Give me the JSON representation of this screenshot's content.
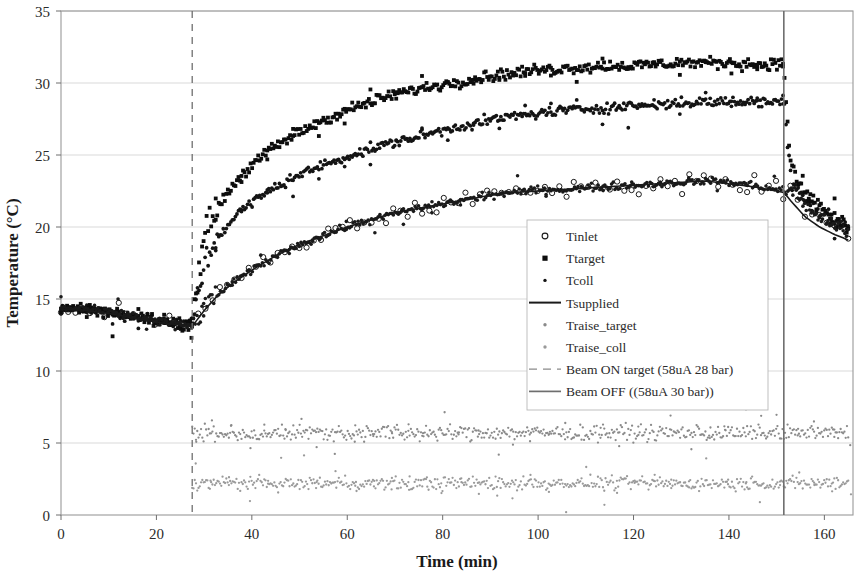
{
  "chart_data": {
    "type": "scatter",
    "title": "",
    "xlabel": "Time (min)",
    "ylabel": "Temperature (°C)",
    "xlim": [
      0,
      166
    ],
    "ylim": [
      0,
      35
    ],
    "xticks": [
      0,
      20,
      40,
      60,
      80,
      100,
      120,
      140,
      160
    ],
    "yticks": [
      0,
      5,
      10,
      15,
      20,
      25,
      30,
      35
    ],
    "grid": true,
    "legend_position": "center-right",
    "beam_on_time": 27.5,
    "beam_off_time": 151.5,
    "series": [
      {
        "name": "Tinlet",
        "marker": "open-circle",
        "color": "#1a1a1a",
        "x": [
          0,
          5,
          10,
          15,
          20,
          25,
          27.5,
          30,
          33,
          36,
          40,
          45,
          50,
          55,
          60,
          65,
          70,
          75,
          80,
          85,
          90,
          95,
          100,
          105,
          110,
          115,
          120,
          125,
          130,
          135,
          140,
          145,
          150,
          151.5,
          153,
          156,
          159,
          162,
          165
        ],
        "y": [
          14.4,
          14.3,
          14.1,
          13.8,
          13.5,
          13.2,
          13.1,
          14.4,
          15.4,
          16.1,
          17.0,
          18.0,
          18.8,
          19.4,
          20.0,
          20.5,
          20.9,
          21.3,
          21.6,
          21.9,
          22.2,
          22.4,
          22.6,
          22.6,
          22.7,
          22.8,
          22.9,
          23.0,
          23.1,
          23.2,
          23.1,
          22.9,
          22.6,
          22.6,
          22.6,
          21.5,
          20.7,
          20.1,
          19.6
        ]
      },
      {
        "name": "Ttarget",
        "marker": "filled-square",
        "color": "#0d0d0d",
        "x": [
          0,
          5,
          10,
          15,
          20,
          25,
          27.5,
          29,
          31,
          34,
          37,
          40,
          45,
          50,
          55,
          60,
          65,
          70,
          75,
          80,
          85,
          90,
          95,
          100,
          105,
          110,
          115,
          120,
          125,
          130,
          135,
          140,
          145,
          150,
          151.5,
          153,
          156,
          159,
          162,
          165
        ],
        "y": [
          14.4,
          14.3,
          14.1,
          13.8,
          13.5,
          13.2,
          13.3,
          17.5,
          20.3,
          22.0,
          23.3,
          24.3,
          25.6,
          26.6,
          27.4,
          28.1,
          28.7,
          29.2,
          29.6,
          29.9,
          30.2,
          30.5,
          30.7,
          30.9,
          31.0,
          31.1,
          31.2,
          31.2,
          31.3,
          31.4,
          31.4,
          31.4,
          31.3,
          31.3,
          31.3,
          24.0,
          22.4,
          21.4,
          20.6,
          20.0
        ]
      },
      {
        "name": "Tcoll",
        "marker": "small-dot",
        "color": "#141414",
        "x": [
          0,
          5,
          10,
          15,
          20,
          25,
          27.5,
          29,
          31,
          34,
          37,
          40,
          45,
          50,
          55,
          60,
          65,
          70,
          75,
          80,
          85,
          90,
          95,
          100,
          105,
          110,
          115,
          120,
          125,
          130,
          135,
          140,
          145,
          150,
          151.5,
          153,
          156,
          159,
          162,
          165
        ],
        "y": [
          14.4,
          14.3,
          14.1,
          13.8,
          13.5,
          13.2,
          13.3,
          16.0,
          18.2,
          19.8,
          20.9,
          21.7,
          22.8,
          23.6,
          24.3,
          24.9,
          25.4,
          25.9,
          26.3,
          26.7,
          27.1,
          27.4,
          27.7,
          27.9,
          28.1,
          28.2,
          28.3,
          28.4,
          28.5,
          28.6,
          28.7,
          28.7,
          28.7,
          28.7,
          28.7,
          23.5,
          22.0,
          21.0,
          20.3,
          19.8
        ]
      },
      {
        "name": "Tsupplied",
        "marker": "line",
        "color": "#1a1a1a",
        "x": [
          0,
          5,
          10,
          15,
          20,
          25,
          27.5,
          30,
          33,
          36,
          40,
          45,
          50,
          55,
          60,
          65,
          70,
          75,
          80,
          85,
          90,
          95,
          100,
          105,
          110,
          115,
          120,
          125,
          130,
          135,
          140,
          145,
          150,
          151.5,
          153,
          156,
          159,
          162,
          165
        ],
        "y": [
          14.3,
          14.2,
          14.0,
          13.7,
          13.4,
          13.2,
          13.1,
          14.2,
          15.3,
          16.1,
          17.0,
          18.0,
          18.8,
          19.4,
          20.0,
          20.5,
          21.0,
          21.3,
          21.6,
          21.9,
          22.2,
          22.4,
          22.5,
          22.6,
          22.7,
          22.8,
          22.9,
          23.0,
          23.1,
          23.2,
          23.0,
          22.8,
          22.5,
          22.4,
          21.8,
          20.7,
          20.0,
          19.5,
          19.1
        ]
      },
      {
        "name": "Traise_target",
        "marker": "small-dot",
        "color": "#8a8a8a",
        "constant_value": 5.7,
        "x_start": 27.5,
        "x_end": 165,
        "scatter_spread": 0.45
      },
      {
        "name": "Traise_coll",
        "marker": "small-dot",
        "color": "#9a9a9a",
        "constant_value": 2.2,
        "x_start": 27.5,
        "x_end": 165,
        "scatter_spread": 0.4
      }
    ],
    "vlines": [
      {
        "name": "Beam ON target (58uA 28 bar)",
        "x": 27.5,
        "style": "dashed",
        "color": "#6e6e6e"
      },
      {
        "name": "Beam OFF ((58uA 30 bar))",
        "x": 151.5,
        "style": "solid",
        "color": "#6e6e6e"
      }
    ],
    "legend": [
      {
        "label": "Tinlet",
        "marker": "open-circle",
        "color": "#1a1a1a"
      },
      {
        "label": "Ttarget",
        "marker": "filled-square",
        "color": "#0d0d0d"
      },
      {
        "label": "Tcoll",
        "marker": "small-dot",
        "color": "#141414"
      },
      {
        "label": "Tsupplied",
        "marker": "line",
        "color": "#1a1a1a"
      },
      {
        "label": "Traise_target",
        "marker": "small-dot",
        "color": "#8a8a8a"
      },
      {
        "label": "Traise_coll",
        "marker": "small-dot",
        "color": "#9a9a9a"
      },
      {
        "label": "Beam ON target (58uA 28 bar)",
        "marker": "dashed-line",
        "color": "#8a8a8a"
      },
      {
        "label": "Beam OFF ((58uA 30 bar))",
        "marker": "solid-line",
        "color": "#6e6e6e"
      }
    ]
  }
}
